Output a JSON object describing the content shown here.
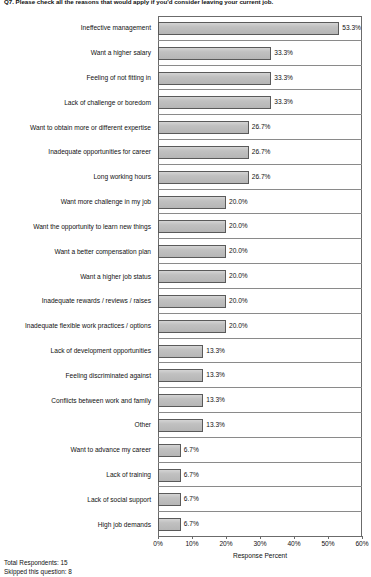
{
  "chart_data": {
    "type": "bar",
    "orientation": "horizontal",
    "title": "Q7. Please check all the reasons that would apply if you'd consider leaving your current job.",
    "xlabel": "Response Percent",
    "ylabel": "",
    "xlim": [
      0,
      60
    ],
    "grid": false,
    "legend": null,
    "bar_color": "#bdbdbd",
    "bar_border_color": "#5a5a5a",
    "xticks": [
      "0%",
      "10%",
      "20%",
      "30%",
      "40%",
      "50%",
      "60%"
    ],
    "xtick_values": [
      0,
      10,
      20,
      30,
      40,
      50,
      60
    ],
    "categories": [
      "Ineffective management",
      "Want a higher salary",
      "Feeling of not fitting in",
      "Lack of challenge or boredom",
      "Want to obtain more or different expertise",
      "Inadequate opportunities for career",
      "Long working hours",
      "Want more challenge in my job",
      "Want the opportunity to learn new things",
      "Want a better compensation plan",
      "Want a higher job status",
      "Inadequate rewards / reviews / raises",
      "Inadequate flexible work practices / options",
      "Lack of development opportunities",
      "Feeling discriminated against",
      "Conflicts between work and family",
      "Other",
      "Want to advance my career",
      "Lack of training",
      "Lack of social support",
      "High job demands"
    ],
    "values": [
      53.3,
      33.3,
      33.3,
      33.3,
      26.7,
      26.7,
      26.7,
      20.0,
      20.0,
      20.0,
      20.0,
      20.0,
      20.0,
      13.3,
      13.3,
      13.3,
      13.3,
      6.7,
      6.7,
      6.7,
      6.7
    ],
    "value_labels": [
      "53.3%",
      "33.3%",
      "33.3%",
      "33.3%",
      "26.7%",
      "26.7%",
      "26.7%",
      "20.0%",
      "20.0%",
      "20.0%",
      "20.0%",
      "20.0%",
      "20.0%",
      "13.3%",
      "13.3%",
      "13.3%",
      "13.3%",
      "6.7%",
      "6.7%",
      "6.7%",
      "6.7%"
    ]
  },
  "footer": {
    "total_respondents": "Total Respondents: 15",
    "skipped": "Skipped this question: 8"
  }
}
